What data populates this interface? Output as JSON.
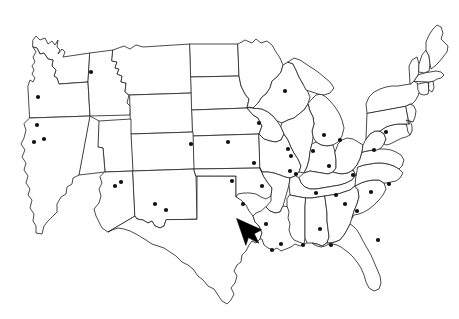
{
  "image": {
    "title": "United States map with city point markers",
    "description": "Black outline map of the contiguous United States showing state boundaries, small black dots marking cities, and a solid black mouse-cursor arrow positioned over eastern Texas",
    "background_color": "#ffffff",
    "outline_color": "#2b2b2b",
    "dot_color": "#111111",
    "cursor_color": "#000000",
    "width": 459,
    "height": 319
  },
  "chart_data": {
    "type": "map",
    "title": "",
    "projection": "contiguous-united-states",
    "grid": false,
    "legend": null,
    "xlabel": "",
    "ylabel": "",
    "xlim": [
      0,
      459
    ],
    "ylim": [
      0,
      319
    ],
    "marker": {
      "shape": "circle",
      "radius_px": 2.1,
      "color": "#111111"
    },
    "points": [
      {
        "label": "city-01",
        "x": 38,
        "y": 97
      },
      {
        "label": "city-02",
        "x": 37,
        "y": 125
      },
      {
        "label": "city-03",
        "x": 34,
        "y": 142
      },
      {
        "label": "city-04",
        "x": 44,
        "y": 139
      },
      {
        "label": "city-05",
        "x": 91,
        "y": 72
      },
      {
        "label": "city-06",
        "x": 115,
        "y": 186
      },
      {
        "label": "city-07",
        "x": 121,
        "y": 182
      },
      {
        "label": "city-08",
        "x": 155,
        "y": 204
      },
      {
        "label": "city-09",
        "x": 166,
        "y": 210
      },
      {
        "label": "city-10",
        "x": 191,
        "y": 144
      },
      {
        "label": "city-11",
        "x": 228,
        "y": 142
      },
      {
        "label": "city-12",
        "x": 232,
        "y": 181
      },
      {
        "label": "city-13",
        "x": 243,
        "y": 204
      },
      {
        "label": "city-14",
        "x": 254,
        "y": 163
      },
      {
        "label": "city-15",
        "x": 259,
        "y": 123
      },
      {
        "label": "city-16",
        "x": 262,
        "y": 186
      },
      {
        "label": "city-17",
        "x": 266,
        "y": 224
      },
      {
        "label": "city-18",
        "x": 272,
        "y": 250
      },
      {
        "label": "city-19",
        "x": 281,
        "y": 244
      },
      {
        "label": "city-20",
        "x": 285,
        "y": 91
      },
      {
        "label": "city-21",
        "x": 288,
        "y": 149
      },
      {
        "label": "city-22",
        "x": 291,
        "y": 156
      },
      {
        "label": "city-23",
        "x": 290,
        "y": 171
      },
      {
        "label": "city-24",
        "x": 296,
        "y": 174
      },
      {
        "label": "city-25",
        "x": 303,
        "y": 245
      },
      {
        "label": "city-26",
        "x": 313,
        "y": 151
      },
      {
        "label": "city-27",
        "x": 316,
        "y": 193
      },
      {
        "label": "city-28",
        "x": 320,
        "y": 229
      },
      {
        "label": "city-29",
        "x": 324,
        "y": 135
      },
      {
        "label": "city-30",
        "x": 329,
        "y": 166
      },
      {
        "label": "city-31",
        "x": 331,
        "y": 245
      },
      {
        "label": "city-32",
        "x": 336,
        "y": 195
      },
      {
        "label": "city-33",
        "x": 340,
        "y": 140
      },
      {
        "label": "city-34",
        "x": 345,
        "y": 204
      },
      {
        "label": "city-35",
        "x": 353,
        "y": 175
      },
      {
        "label": "city-36",
        "x": 357,
        "y": 211
      },
      {
        "label": "city-37",
        "x": 371,
        "y": 192
      },
      {
        "label": "city-38",
        "x": 374,
        "y": 150
      },
      {
        "label": "city-39",
        "x": 386,
        "y": 132
      },
      {
        "label": "city-40",
        "x": 389,
        "y": 184
      },
      {
        "label": "city-41",
        "x": 378,
        "y": 240
      }
    ],
    "annotations": [
      {
        "type": "cursor-arrow",
        "label": "mouse-cursor",
        "x": 246,
        "y": 229,
        "region": "eastern Texas",
        "color": "#000000"
      }
    ]
  }
}
